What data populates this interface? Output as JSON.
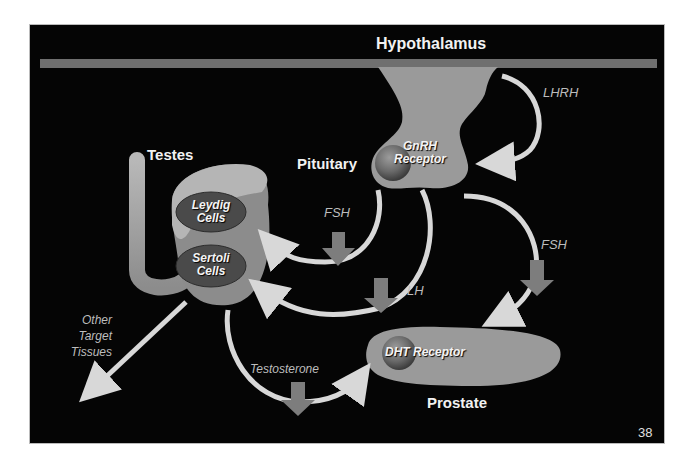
{
  "slide": {
    "page_number": "38",
    "colors": {
      "background": "#050505",
      "organ_fill": "#9a9a9a",
      "organ_light": "#b5b5b5",
      "receptor_sphere": "#6e6e6e",
      "cell_oval": "#4a4a4a",
      "arrow_line": "#d8d8d8",
      "hormone_block_arrow": "#7d7d7d",
      "label_text": "#f2f2f2",
      "hormone_text": "#bdbdbd"
    }
  },
  "labels": {
    "hypothalamus": "Hypothalamus",
    "pituitary": "Pituitary",
    "testes": "Testes",
    "prostate": "Prostate"
  },
  "receptors": {
    "gnrh_line1": "GnRH",
    "gnrh_line2": "Receptor",
    "dht": "DHT Receptor"
  },
  "cells": {
    "leydig_line1": "Leydig",
    "leydig_line2": "Cells",
    "sertoli_line1": "Sertoli",
    "sertoli_line2": "Cells"
  },
  "hormones": {
    "lhrh": "LHRH",
    "fsh_to_testes": "FSH",
    "lh": "LH",
    "fsh_to_prostate": "FSH",
    "testosterone": "Testosterone"
  },
  "other_targets": {
    "line1": "Other",
    "line2": "Target",
    "line3": "Tissues"
  }
}
